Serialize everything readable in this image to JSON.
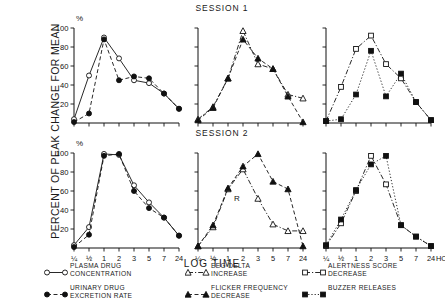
{
  "figure": {
    "ylabel": "PERCENT OF PEAK CHANGE FOR MEAN",
    "xlabel": "LOG TIME",
    "percent_symbol": "%",
    "hours_unit": "HOURS",
    "session1_title": "SESSION 1",
    "session2_title": "SESSION 2",
    "annotation_r": "R"
  },
  "legend": {
    "entries": [
      {
        "id": "plasma-drug-concentration",
        "label": "PLASMA DRUG\nCONCENTRATION",
        "marker": "open-circle",
        "line": "solid"
      },
      {
        "id": "urinary-drug-excretion-rate",
        "label": "URINARY DRUG\nEXCRETION RATE",
        "marker": "filled-circle",
        "line": "dashed"
      },
      {
        "id": "eeg-delta-increase",
        "label": "EEG DELTA\nINCREASE",
        "marker": "open-triangle",
        "line": "dashdot"
      },
      {
        "id": "flicker-frequency-decrease",
        "label": "FLICKER FREQUENCY\nDECREASE",
        "marker": "filled-triangle",
        "line": "dashed"
      },
      {
        "id": "alertness-score-decrease",
        "label": "ALERTNESS SCORE\nDECREASE",
        "marker": "open-square",
        "line": "dashdot"
      },
      {
        "id": "buzzer-releases",
        "label": "BUZZER RELEASES",
        "marker": "filled-square",
        "line": "dotted"
      }
    ]
  },
  "chart_data": {
    "type": "line",
    "xlabel": "LOG TIME",
    "ylabel": "PERCENT OF PEAK CHANGE FOR MEAN",
    "ylim": [
      0,
      100
    ],
    "yticks": [
      20,
      40,
      60,
      80,
      100
    ],
    "ytick_labels": [
      "20",
      "40",
      "60",
      "80",
      "100"
    ],
    "x": [
      "1/4",
      "1/2",
      "1",
      "2",
      "3",
      "5",
      "7",
      "24"
    ],
    "xtick_labels": [
      "¼",
      "½",
      "1",
      "2",
      "3",
      "5",
      "7",
      "24"
    ],
    "x_unit": "HOURS",
    "grid": false,
    "legend_position": "below",
    "panels": [
      {
        "id": "session1-drug",
        "session": "SESSION 1",
        "row": 1,
        "col": 1,
        "show_y_axis": true,
        "show_x_labels": false,
        "series": [
          {
            "name": "PLASMA DRUG CONCENTRATION",
            "marker": "open-circle",
            "line": "solid",
            "values": [
              4,
              50,
              90,
              68,
              45,
              42,
              31,
              15
            ]
          },
          {
            "name": "URINARY DRUG EXCRETION RATE",
            "marker": "filled-circle",
            "line": "dashed",
            "values": [
              1,
              10,
              88,
              45,
              49,
              47,
              31,
              15
            ]
          }
        ]
      },
      {
        "id": "session1-eeg",
        "session": "SESSION 1",
        "row": 1,
        "col": 2,
        "show_y_axis": true,
        "show_x_labels": false,
        "series": [
          {
            "name": "EEG DELTA INCREASE",
            "marker": "open-triangle",
            "line": "dashdot",
            "values": [
              4,
              17,
              47,
              97,
              62,
              57,
              30,
              26
            ]
          },
          {
            "name": "FLICKER FREQUENCY DECREASE",
            "marker": "filled-triangle",
            "line": "dashed",
            "values": [
              3,
              16,
              47,
              88,
              68,
              57,
              28,
              1
            ]
          }
        ]
      },
      {
        "id": "session1-alertness",
        "session": "SESSION 1",
        "row": 1,
        "col": 3,
        "show_y_axis": true,
        "show_x_labels": false,
        "series": [
          {
            "name": "ALERTNESS SCORE DECREASE",
            "marker": "open-square",
            "line": "dashdot",
            "values": [
              2,
              38,
              78,
              92,
              62,
              47,
              22,
              3
            ]
          },
          {
            "name": "BUZZER RELEASES",
            "marker": "filled-square",
            "line": "dotted",
            "values": [
              2,
              4,
              30,
              76,
              28,
              52,
              22,
              3
            ]
          }
        ]
      },
      {
        "id": "session2-drug",
        "session": "SESSION 2",
        "row": 2,
        "col": 1,
        "show_y_axis": true,
        "show_x_labels": true,
        "series": [
          {
            "name": "PLASMA DRUG CONCENTRATION",
            "marker": "open-circle",
            "line": "solid",
            "values": [
              3,
              22,
              99,
              98,
              66,
              48,
              32,
              13
            ]
          },
          {
            "name": "URINARY DRUG EXCRETION RATE",
            "marker": "filled-circle",
            "line": "dashed",
            "values": [
              1,
              14,
              97,
              99,
              60,
              42,
              32,
              13
            ]
          }
        ]
      },
      {
        "id": "session2-eeg",
        "session": "SESSION 2",
        "row": 2,
        "col": 2,
        "show_y_axis": true,
        "show_x_labels": true,
        "series": [
          {
            "name": "EEG DELTA INCREASE",
            "marker": "open-triangle",
            "line": "dashdot",
            "values": [
              2,
              22,
              62,
              83,
              52,
              25,
              18,
              18
            ]
          },
          {
            "name": "FLICKER FREQUENCY DECREASE",
            "marker": "filled-triangle",
            "line": "dashed",
            "values": [
              2,
              24,
              63,
              86,
              99,
              70,
              62,
              2
            ]
          }
        ]
      },
      {
        "id": "session2-alertness",
        "session": "SESSION 2",
        "row": 2,
        "col": 3,
        "show_y_axis": true,
        "show_x_labels": true,
        "series": [
          {
            "name": "ALERTNESS SCORE DECREASE",
            "marker": "open-square",
            "line": "dashdot",
            "values": [
              2,
              26,
              60,
              97,
              67,
              24,
              12,
              2
            ]
          },
          {
            "name": "BUZZER RELEASES",
            "marker": "filled-square",
            "line": "dotted",
            "values": [
              3,
              30,
              61,
              88,
              97,
              24,
              12,
              2
            ]
          }
        ]
      }
    ]
  }
}
